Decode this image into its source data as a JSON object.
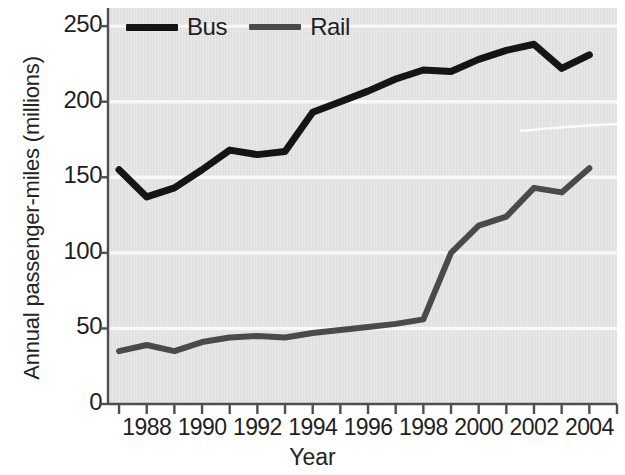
{
  "chart_data": {
    "type": "line",
    "title": "",
    "xlabel": "Year",
    "ylabel": "Annual passenger-miles (millions)",
    "xlim": [
      1986.6,
      2005.0
    ],
    "ylim": [
      0,
      262
    ],
    "yticks": [
      0,
      50,
      100,
      150,
      200,
      250
    ],
    "ytick_labels": [
      "0",
      "50",
      "100",
      "150",
      "200",
      "250"
    ],
    "xticks": [
      1988,
      1990,
      1992,
      1994,
      1996,
      1998,
      2000,
      2002,
      2004
    ],
    "xtick_labels": [
      "1988",
      "1990",
      "1992",
      "1994",
      "1996",
      "1998",
      "2000",
      "2002",
      "2004"
    ],
    "x_minor_ticks": [
      1987,
      1989,
      1991,
      1993,
      1995,
      1997,
      1999,
      2001,
      2003,
      2005
    ],
    "grid": "horizontal-white",
    "legend_position": "top-left-inside",
    "plot_background": "#e3e3e3",
    "gridline_color": "#fafafa",
    "x": [
      1987,
      1988,
      1989,
      1990,
      1991,
      1992,
      1993,
      1994,
      1995,
      1996,
      1997,
      1998,
      1999,
      2000,
      2001,
      2002,
      2003,
      2004
    ],
    "series": [
      {
        "name": "Bus",
        "color": "#151515",
        "line_width": 7,
        "values": [
          155,
          137,
          143,
          155,
          168,
          165,
          167,
          193,
          200,
          207,
          215,
          221,
          220,
          228,
          234,
          238,
          222,
          231
        ]
      },
      {
        "name": "Rail",
        "color": "#4a4a4a",
        "line_width": 6,
        "values": [
          35,
          39,
          35,
          41,
          44,
          45,
          44,
          47,
          49,
          51,
          53,
          56,
          100,
          118,
          124,
          143,
          140,
          156
        ]
      }
    ]
  },
  "legend": {
    "items": [
      {
        "label": "Bus",
        "color": "#151515"
      },
      {
        "label": "Rail",
        "color": "#4a4a4a"
      }
    ]
  },
  "axes": {
    "x_title": "Year",
    "y_title": "Annual passenger-miles (millions)"
  }
}
